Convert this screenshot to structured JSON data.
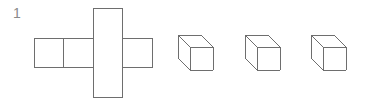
{
  "figure": {
    "question_number": "1",
    "stroke_color": "#6e6e6e",
    "background_color": "#ffffff",
    "stroke_width": 1,
    "label_color": "#8a8a8a",
    "net": {
      "name": "cube-net-cross",
      "description": "Unfolded cube net shaped like a cross",
      "cell_size": 29.5,
      "origin_x": 34,
      "origin_y": 38,
      "row_cells": 4,
      "row_labels": [
        "net-face-1",
        "net-face-2",
        "net-face-3",
        "net-face-4"
      ],
      "top_cell_column_index": 2,
      "bottom_cell_column_index": 2,
      "top_label": "net-face-top",
      "bottom_label": "net-face-bottom",
      "bounds": {
        "left": 34,
        "top": 8,
        "right": 152,
        "bottom": 97
      }
    },
    "cubes": [
      {
        "name": "cube-option-a",
        "front_left": 190,
        "front_top": 47,
        "size": 23,
        "depth_x": -12,
        "depth_y": -12
      },
      {
        "name": "cube-option-b",
        "front_left": 257,
        "front_top": 47,
        "size": 23,
        "depth_x": -12,
        "depth_y": -12
      },
      {
        "name": "cube-option-c",
        "front_left": 323,
        "front_top": 47,
        "size": 23,
        "depth_x": -12,
        "depth_y": -12
      }
    ]
  }
}
